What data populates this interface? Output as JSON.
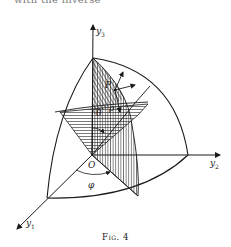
{
  "header": {
    "text": "with the inverse"
  },
  "figure": {
    "axes": {
      "y1": {
        "label": "y",
        "subscript": "1"
      },
      "y2": {
        "label": "y",
        "subscript": "2"
      },
      "y3": {
        "label": "y",
        "subscript": "3"
      }
    },
    "points": {
      "origin": "O",
      "point": "P"
    },
    "symbols": {
      "theta": "θ",
      "phi": "φ",
      "rho": "ρ"
    }
  },
  "caption": "Fig. 4"
}
